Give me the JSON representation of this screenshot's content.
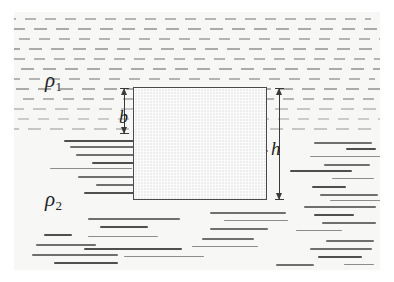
{
  "figure": {
    "background_color": "#ffffff",
    "fluid_tint_color": "#f7f7f6",
    "ink_color": "#3a3a3a"
  },
  "labels": {
    "upper_fluid_density": {
      "symbol": "ρ",
      "subscript": "1"
    },
    "lower_fluid_density": {
      "symbol": "ρ",
      "subscript": "2"
    },
    "depth_above_interface": "b",
    "block_height": "h"
  },
  "block": {
    "name": "floating-block",
    "fill_color": "#ededed",
    "border_color": "#4a4a4a",
    "left": 133,
    "top": 87,
    "width": 134,
    "height": 113
  },
  "dimensions": [
    {
      "name": "b",
      "label": "b",
      "orientation": "vertical",
      "spans": "top of block to fluid interface",
      "x": 124,
      "top": 88,
      "height": 46
    },
    {
      "name": "h",
      "label": "h",
      "orientation": "vertical",
      "spans": "full block height",
      "x": 279,
      "top": 88,
      "height": 112
    }
  ],
  "fluids": {
    "upper": {
      "name": "fluid-upper",
      "hatch_style": "regular-dashes",
      "region_top": 12,
      "region_height": 124
    },
    "lower": {
      "name": "fluid-lower",
      "hatch_style": "irregular-long-strokes",
      "region_top": 136,
      "region_height": 134
    },
    "interface_y": 136
  },
  "upper_dash_rows_y": [
    6,
    16,
    26,
    36,
    46,
    56,
    66,
    76,
    86,
    96,
    106,
    116
  ],
  "lower_strokes": [
    {
      "x": 50,
      "y": 4,
      "w": 72,
      "c": "dark"
    },
    {
      "x": 56,
      "y": 10,
      "w": 120,
      "c": ""
    },
    {
      "x": 170,
      "y": 8,
      "w": 64,
      "c": "thin"
    },
    {
      "x": 300,
      "y": 6,
      "w": 58,
      "c": ""
    },
    {
      "x": 332,
      "y": 12,
      "w": 30,
      "c": "dark"
    },
    {
      "x": 176,
      "y": 14,
      "w": 78,
      "c": ""
    },
    {
      "x": 62,
      "y": 18,
      "w": 100,
      "c": ""
    },
    {
      "x": 296,
      "y": 20,
      "w": 70,
      "c": "thin"
    },
    {
      "x": 78,
      "y": 26,
      "w": 56,
      "c": "dark"
    },
    {
      "x": 310,
      "y": 28,
      "w": 46,
      "c": ""
    },
    {
      "x": 36,
      "y": 32,
      "w": 82,
      "c": "thin"
    },
    {
      "x": 276,
      "y": 34,
      "w": 62,
      "c": "dark"
    },
    {
      "x": 64,
      "y": 40,
      "w": 88,
      "c": ""
    },
    {
      "x": 318,
      "y": 42,
      "w": 42,
      "c": "thin"
    },
    {
      "x": 82,
      "y": 48,
      "w": 54,
      "c": ""
    },
    {
      "x": 298,
      "y": 50,
      "w": 34,
      "c": "dark"
    },
    {
      "x": 70,
      "y": 56,
      "w": 66,
      "c": "dark"
    },
    {
      "x": 306,
      "y": 58,
      "w": 58,
      "c": ""
    },
    {
      "x": 316,
      "y": 64,
      "w": 50,
      "c": "thin"
    },
    {
      "x": 290,
      "y": 70,
      "w": 72,
      "c": ""
    },
    {
      "x": 196,
      "y": 76,
      "w": 76,
      "c": ""
    },
    {
      "x": 300,
      "y": 78,
      "w": 40,
      "c": "dark"
    },
    {
      "x": 74,
      "y": 82,
      "w": 92,
      "c": ""
    },
    {
      "x": 210,
      "y": 84,
      "w": 64,
      "c": "thin"
    },
    {
      "x": 308,
      "y": 86,
      "w": 54,
      "c": ""
    },
    {
      "x": 86,
      "y": 90,
      "w": 48,
      "c": "dark"
    },
    {
      "x": 196,
      "y": 92,
      "w": 58,
      "c": ""
    },
    {
      "x": 282,
      "y": 94,
      "w": 46,
      "c": "thin"
    },
    {
      "x": 30,
      "y": 98,
      "w": 28,
      "c": "dark"
    },
    {
      "x": 74,
      "y": 100,
      "w": 70,
      "c": "thin"
    },
    {
      "x": 188,
      "y": 102,
      "w": 52,
      "c": ""
    },
    {
      "x": 312,
      "y": 104,
      "w": 48,
      "c": ""
    },
    {
      "x": 22,
      "y": 108,
      "w": 60,
      "c": ""
    },
    {
      "x": 70,
      "y": 112,
      "w": 98,
      "c": "dark"
    },
    {
      "x": 178,
      "y": 110,
      "w": 66,
      "c": "thin"
    },
    {
      "x": 296,
      "y": 112,
      "w": 62,
      "c": ""
    },
    {
      "x": 18,
      "y": 118,
      "w": 86,
      "c": ""
    },
    {
      "x": 110,
      "y": 120,
      "w": 80,
      "c": "thin"
    },
    {
      "x": 304,
      "y": 120,
      "w": 44,
      "c": "dark"
    },
    {
      "x": 40,
      "y": 126,
      "w": 64,
      "c": "dark"
    },
    {
      "x": 262,
      "y": 128,
      "w": 38,
      "c": ""
    },
    {
      "x": 330,
      "y": 128,
      "w": 30,
      "c": "thin"
    }
  ]
}
